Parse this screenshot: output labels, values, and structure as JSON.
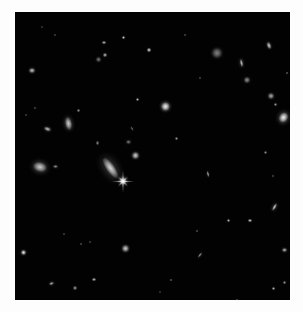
{
  "image": {
    "subject": "deep field of distant galaxies against black space",
    "border_color": "#fdfdfd",
    "sky_color": "#020202",
    "field": {
      "x": 15,
      "y": 12,
      "w": 275,
      "h": 288
    }
  },
  "objects": [
    {
      "kind": "spiral-galaxy",
      "x": 110,
      "y": 168,
      "w": 9,
      "h": 24,
      "rot": -35,
      "b": 0.85
    },
    {
      "kind": "star",
      "x": 123,
      "y": 181,
      "w": 8,
      "h": 8,
      "rot": 0,
      "b": 1.0,
      "spikes": true
    },
    {
      "kind": "galaxy",
      "x": 135,
      "y": 155,
      "w": 7,
      "h": 7,
      "rot": 0,
      "b": 0.8
    },
    {
      "kind": "galaxy",
      "x": 40,
      "y": 167,
      "w": 14,
      "h": 10,
      "rot": 15,
      "b": 0.8
    },
    {
      "kind": "galaxy",
      "x": 55,
      "y": 166,
      "w": 5,
      "h": 3,
      "rot": 0,
      "b": 0.55
    },
    {
      "kind": "galaxy",
      "x": 68,
      "y": 123,
      "w": 7,
      "h": 13,
      "rot": -10,
      "b": 0.8
    },
    {
      "kind": "galaxy",
      "x": 47,
      "y": 129,
      "w": 7,
      "h": 4,
      "rot": 20,
      "b": 0.75
    },
    {
      "kind": "galaxy",
      "x": 165,
      "y": 106,
      "w": 9,
      "h": 9,
      "rot": 0,
      "b": 0.95
    },
    {
      "kind": "galaxy",
      "x": 283,
      "y": 117,
      "w": 9,
      "h": 11,
      "rot": 30,
      "b": 0.95
    },
    {
      "kind": "galaxy",
      "x": 271,
      "y": 96,
      "w": 6,
      "h": 6,
      "rot": 0,
      "b": 0.65
    },
    {
      "kind": "galaxy",
      "x": 217,
      "y": 53,
      "w": 10,
      "h": 10,
      "rot": 0,
      "b": 0.5
    },
    {
      "kind": "galaxy",
      "x": 241,
      "y": 63,
      "w": 3,
      "h": 8,
      "rot": -10,
      "b": 0.75
    },
    {
      "kind": "galaxy",
      "x": 247,
      "y": 80,
      "w": 6,
      "h": 6,
      "rot": 0,
      "b": 0.55
    },
    {
      "kind": "galaxy",
      "x": 269,
      "y": 45,
      "w": 4,
      "h": 7,
      "rot": -20,
      "b": 0.8
    },
    {
      "kind": "galaxy",
      "x": 32,
      "y": 70,
      "w": 6,
      "h": 5,
      "rot": 0,
      "b": 0.75
    },
    {
      "kind": "galaxy",
      "x": 98,
      "y": 59,
      "w": 5,
      "h": 5,
      "rot": 0,
      "b": 0.45
    },
    {
      "kind": "galaxy",
      "x": 105,
      "y": 55,
      "w": 4,
      "h": 4,
      "rot": 0,
      "b": 0.7
    },
    {
      "kind": "galaxy",
      "x": 104,
      "y": 42,
      "w": 4,
      "h": 3,
      "rot": 0,
      "b": 0.75
    },
    {
      "kind": "galaxy",
      "x": 123,
      "y": 37,
      "w": 3,
      "h": 3,
      "rot": 0,
      "b": 0.8
    },
    {
      "kind": "galaxy",
      "x": 149,
      "y": 50,
      "w": 4,
      "h": 4,
      "rot": 0,
      "b": 0.85
    },
    {
      "kind": "galaxy",
      "x": 23,
      "y": 252,
      "w": 5,
      "h": 5,
      "rot": 0,
      "b": 0.9
    },
    {
      "kind": "galaxy",
      "x": 125,
      "y": 248,
      "w": 7,
      "h": 7,
      "rot": 0,
      "b": 0.8
    },
    {
      "kind": "galaxy",
      "x": 200,
      "y": 255,
      "w": 2,
      "h": 6,
      "rot": 40,
      "b": 0.6
    },
    {
      "kind": "galaxy",
      "x": 274,
      "y": 207,
      "w": 3,
      "h": 8,
      "rot": 30,
      "b": 0.8
    },
    {
      "kind": "galaxy",
      "x": 250,
      "y": 220,
      "w": 4,
      "h": 3,
      "rot": 0,
      "b": 0.8
    },
    {
      "kind": "galaxy",
      "x": 284,
      "y": 250,
      "w": 5,
      "h": 4,
      "rot": 0,
      "b": 0.7
    },
    {
      "kind": "galaxy",
      "x": 208,
      "y": 174,
      "w": 2,
      "h": 6,
      "rot": -10,
      "b": 0.7
    },
    {
      "kind": "galaxy",
      "x": 51,
      "y": 283,
      "w": 5,
      "h": 3,
      "rot": -15,
      "b": 0.65
    },
    {
      "kind": "galaxy",
      "x": 75,
      "y": 288,
      "w": 4,
      "h": 4,
      "rot": 0,
      "b": 0.6
    },
    {
      "kind": "galaxy",
      "x": 94,
      "y": 279,
      "w": 4,
      "h": 3,
      "rot": 0,
      "b": 0.75
    },
    {
      "kind": "galaxy",
      "x": 128,
      "y": 142,
      "w": 5,
      "h": 4,
      "rot": 0,
      "b": 0.45
    },
    {
      "kind": "galaxy",
      "x": 97,
      "y": 143,
      "w": 3,
      "h": 4,
      "rot": 0,
      "b": 0.55
    },
    {
      "kind": "galaxy",
      "x": 132,
      "y": 128,
      "w": 2,
      "h": 5,
      "rot": -30,
      "b": 0.4
    },
    {
      "kind": "galaxy",
      "x": 228,
      "y": 220,
      "w": 3,
      "h": 3,
      "rot": 0,
      "b": 0.7
    },
    {
      "kind": "galaxy",
      "x": 275,
      "y": 104,
      "w": 3,
      "h": 3,
      "rot": 0,
      "b": 0.6
    },
    {
      "kind": "galaxy",
      "x": 287,
      "y": 73,
      "w": 2,
      "h": 2,
      "rot": 0,
      "b": 0.6
    },
    {
      "kind": "galaxy",
      "x": 200,
      "y": 78,
      "w": 2,
      "h": 2,
      "rot": 0,
      "b": 0.5
    },
    {
      "kind": "galaxy",
      "x": 137,
      "y": 99,
      "w": 3,
      "h": 3,
      "rot": 0,
      "b": 0.7
    },
    {
      "kind": "galaxy",
      "x": 176,
      "y": 138,
      "w": 3,
      "h": 3,
      "rot": 0,
      "b": 0.6
    },
    {
      "kind": "galaxy",
      "x": 265,
      "y": 152,
      "w": 3,
      "h": 3,
      "rot": 0,
      "b": 0.55
    },
    {
      "kind": "galaxy",
      "x": 273,
      "y": 288,
      "w": 3,
      "h": 3,
      "rot": 0,
      "b": 0.7
    },
    {
      "kind": "galaxy",
      "x": 284,
      "y": 282,
      "w": 3,
      "h": 3,
      "rot": 0,
      "b": 0.6
    },
    {
      "kind": "galaxy",
      "x": 171,
      "y": 280,
      "w": 2,
      "h": 2,
      "rot": 0,
      "b": 0.6
    },
    {
      "kind": "galaxy",
      "x": 197,
      "y": 231,
      "w": 2,
      "h": 2,
      "rot": 0,
      "b": 0.55
    },
    {
      "kind": "galaxy",
      "x": 81,
      "y": 244,
      "w": 2,
      "h": 2,
      "rot": 0,
      "b": 0.5
    },
    {
      "kind": "galaxy",
      "x": 90,
      "y": 242,
      "w": 2,
      "h": 2,
      "rot": 0,
      "b": 0.45
    },
    {
      "kind": "galaxy",
      "x": 237,
      "y": 300,
      "w": 2,
      "h": 2,
      "rot": 0,
      "b": 0.5
    },
    {
      "kind": "galaxy",
      "x": 35,
      "y": 108,
      "w": 2,
      "h": 2,
      "rot": 0,
      "b": 0.5
    },
    {
      "kind": "galaxy",
      "x": 26,
      "y": 115,
      "w": 2,
      "h": 2,
      "rot": 0,
      "b": 0.45
    },
    {
      "kind": "galaxy",
      "x": 78,
      "y": 110,
      "w": 3,
      "h": 3,
      "rot": 0,
      "b": 0.6
    },
    {
      "kind": "galaxy",
      "x": 64,
      "y": 234,
      "w": 2,
      "h": 2,
      "rot": 0,
      "b": 0.45
    },
    {
      "kind": "galaxy",
      "x": 160,
      "y": 292,
      "w": 2,
      "h": 2,
      "rot": 0,
      "b": 0.4
    },
    {
      "kind": "galaxy",
      "x": 273,
      "y": 176,
      "w": 2,
      "h": 2,
      "rot": 0,
      "b": 0.5
    },
    {
      "kind": "galaxy",
      "x": 55,
      "y": 35,
      "w": 2,
      "h": 2,
      "rot": 0,
      "b": 0.45
    },
    {
      "kind": "galaxy",
      "x": 42,
      "y": 27,
      "w": 2,
      "h": 2,
      "rot": 0,
      "b": 0.4
    },
    {
      "kind": "galaxy",
      "x": 185,
      "y": 35,
      "w": 2,
      "h": 2,
      "rot": 0,
      "b": 0.5
    }
  ]
}
